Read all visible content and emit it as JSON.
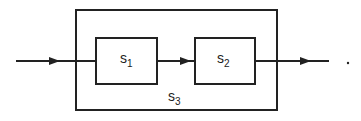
{
  "diagram": {
    "outer_block": {
      "label": "s",
      "subscript": "3"
    },
    "blocks": [
      {
        "label": "s",
        "subscript": "1"
      },
      {
        "label": "s",
        "subscript": "2"
      }
    ],
    "trailing_mark": "."
  }
}
